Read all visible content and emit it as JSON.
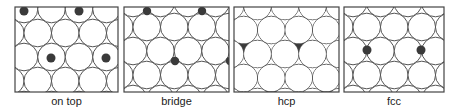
{
  "figure": {
    "style": {
      "circle_stroke": "#555555",
      "circle_fill": "#ffffff",
      "frame_stroke": "#444444",
      "dot_fill": "#3a3a3a",
      "label_color": "#222222"
    },
    "lattice": {
      "radius": 13.8,
      "dx": 27.5,
      "dy": 24.0
    },
    "panels": [
      {
        "id": "on-top",
        "label": "on top",
        "site": "on top",
        "frame": {
          "x": 15,
          "y": 7,
          "w": 103,
          "h": 85
        },
        "grid_origin": {
          "x": 24,
          "y": 9
        },
        "dots_under_circles": false,
        "dot_radius": 4.5,
        "dots": [
          [
            24,
            11
          ],
          [
            79,
            11
          ],
          [
            51,
            58
          ],
          [
            106,
            58
          ]
        ]
      },
      {
        "id": "bridge",
        "label": "bridge",
        "site": "bridge",
        "frame": {
          "x": 124,
          "y": 7,
          "w": 105,
          "h": 85
        },
        "grid_origin": {
          "x": 133,
          "y": 3
        },
        "dots_under_circles": false,
        "dot_radius": 4.2,
        "dots": [
          [
            147,
            11
          ],
          [
            202,
            11
          ],
          [
            175,
            61
          ],
          [
            230,
            61
          ]
        ]
      },
      {
        "id": "hcp",
        "label": "hcp",
        "site": "hcp",
        "frame": {
          "x": 234,
          "y": 7,
          "w": 105,
          "h": 85
        },
        "grid_origin": {
          "x": 230,
          "y": 6
        },
        "dots_under_circles": true,
        "dot_radius": 6,
        "dots": [
          [
            244,
            46
          ],
          [
            299,
            46
          ],
          [
            271,
            92
          ],
          [
            327,
            92
          ]
        ]
      },
      {
        "id": "fcc",
        "label": "fcc",
        "site": "fcc",
        "frame": {
          "x": 344,
          "y": 7,
          "w": 100,
          "h": 85
        },
        "grid_origin": {
          "x": 353,
          "y": 3
        },
        "dots_under_circles": false,
        "dot_radius": 4.5,
        "dots": [
          [
            367,
            50
          ],
          [
            421,
            50
          ]
        ]
      }
    ]
  }
}
